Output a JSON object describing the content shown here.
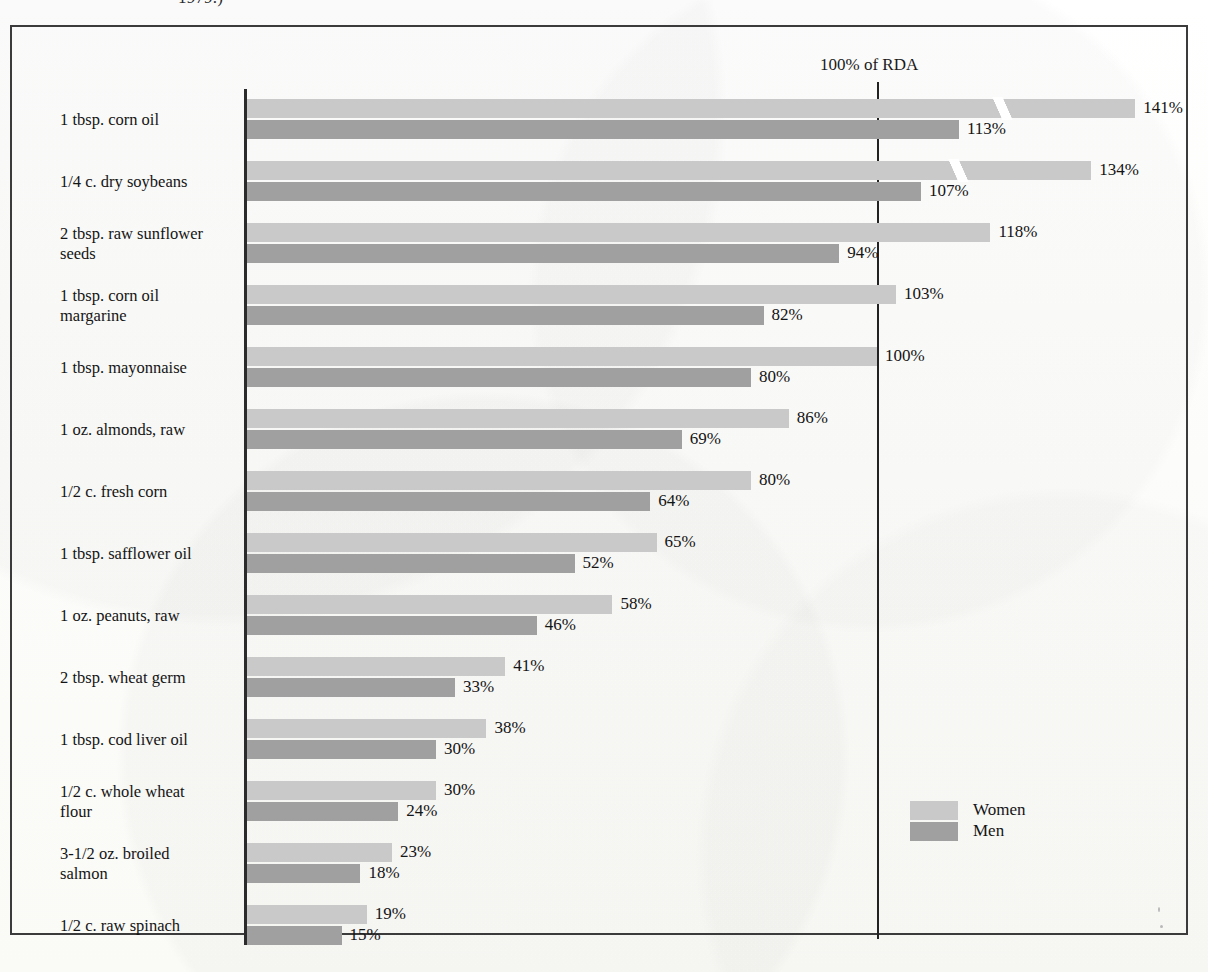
{
  "caption_fragment": "1979.)",
  "reference_line": {
    "label": "100% of RDA",
    "value": 100
  },
  "legend": {
    "items": [
      {
        "name": "Women",
        "color": "#c9c9c9"
      },
      {
        "name": "Men",
        "color": "#a0a0a0"
      }
    ]
  },
  "colors": {
    "women": "#c9c9c9",
    "men": "#a0a0a0",
    "frame": "#3b3b3b",
    "axis": "#2b2b2b",
    "reference_line": "#222222",
    "text": "#141414",
    "background": "#fdfdfc"
  },
  "chart_data": {
    "type": "bar",
    "orientation": "horizontal",
    "title": "",
    "subtitle": "",
    "xlabel": "",
    "ylabel": "",
    "xlim": [
      0,
      141
    ],
    "grid": false,
    "legend_position": "bottom-right",
    "value_suffix": "%",
    "reference_lines": [
      {
        "value": 100,
        "label": "100% of RDA"
      }
    ],
    "scale_break_note": "Bars exceeding about 120% are drawn with a diagonal break slash.",
    "categories": [
      "1 tbsp. corn oil",
      "1/4 c. dry soybeans",
      "2 tbsp. raw sunflower seeds",
      "1 tbsp. corn oil margarine",
      "1 tbsp. mayonnaise",
      "1 oz. almonds, raw",
      "1/2 c. fresh corn",
      "1 tbsp. safflower oil",
      "1 oz. peanuts, raw",
      "2 tbsp. wheat germ",
      "1 tbsp. cod liver oil",
      "1/2 c. whole wheat flour",
      "3-1/2 oz. broiled salmon",
      "1/2 c. raw spinach"
    ],
    "series": [
      {
        "name": "Women",
        "color": "#c9c9c9",
        "values": [
          141,
          134,
          118,
          103,
          100,
          86,
          80,
          65,
          58,
          41,
          38,
          30,
          23,
          19
        ]
      },
      {
        "name": "Men",
        "color": "#a0a0a0",
        "values": [
          113,
          107,
          94,
          82,
          80,
          69,
          64,
          52,
          46,
          33,
          30,
          24,
          18,
          15
        ]
      }
    ]
  },
  "rows": [
    {
      "label": "1 tbsp. corn oil",
      "label_lines": [
        "1 tbsp. corn oil"
      ],
      "women": 141,
      "women_text": "141%",
      "men": 113,
      "men_text": "113%",
      "women_break": true,
      "men_break": false
    },
    {
      "label": "1/4 c. dry soybeans",
      "label_lines": [
        "1/4 c. dry soybeans"
      ],
      "women": 134,
      "women_text": "134%",
      "men": 107,
      "men_text": "107%",
      "women_break": true,
      "men_break": false
    },
    {
      "label": "2 tbsp. raw sunflower seeds",
      "label_lines": [
        "2 tbsp. raw sunflower",
        "seeds"
      ],
      "women": 118,
      "women_text": "118%",
      "men": 94,
      "men_text": "94%",
      "women_break": false,
      "men_break": false
    },
    {
      "label": "1 tbsp. corn oil margarine",
      "label_lines": [
        "1 tbsp. corn oil",
        "margarine"
      ],
      "women": 103,
      "women_text": "103%",
      "men": 82,
      "men_text": "82%",
      "women_break": false,
      "men_break": false
    },
    {
      "label": "1 tbsp. mayonnaise",
      "label_lines": [
        "1 tbsp. mayonnaise"
      ],
      "women": 100,
      "women_text": "100%",
      "men": 80,
      "men_text": "80%",
      "women_break": false,
      "men_break": false
    },
    {
      "label": "1 oz. almonds, raw",
      "label_lines": [
        "1 oz. almonds, raw"
      ],
      "women": 86,
      "women_text": "86%",
      "men": 69,
      "men_text": "69%",
      "women_break": false,
      "men_break": false
    },
    {
      "label": "1/2 c. fresh corn",
      "label_lines": [
        "1/2 c. fresh corn"
      ],
      "women": 80,
      "women_text": "80%",
      "men": 64,
      "men_text": "64%",
      "women_break": false,
      "men_break": false
    },
    {
      "label": "1 tbsp. safflower oil",
      "label_lines": [
        "1 tbsp. safflower oil"
      ],
      "women": 65,
      "women_text": "65%",
      "men": 52,
      "men_text": "52%",
      "women_break": false,
      "men_break": false
    },
    {
      "label": "1 oz. peanuts, raw",
      "label_lines": [
        "1 oz. peanuts, raw"
      ],
      "women": 58,
      "women_text": "58%",
      "men": 46,
      "men_text": "46%",
      "women_break": false,
      "men_break": false
    },
    {
      "label": "2 tbsp. wheat germ",
      "label_lines": [
        "2 tbsp. wheat germ"
      ],
      "women": 41,
      "women_text": "41%",
      "men": 33,
      "men_text": "33%",
      "women_break": false,
      "men_break": false
    },
    {
      "label": "1 tbsp. cod liver oil",
      "label_lines": [
        "1 tbsp. cod liver oil"
      ],
      "women": 38,
      "women_text": "38%",
      "men": 30,
      "men_text": "30%",
      "women_break": false,
      "men_break": false
    },
    {
      "label": "1/2 c. whole wheat flour",
      "label_lines": [
        "1/2 c. whole wheat",
        "flour"
      ],
      "women": 30,
      "women_text": "30%",
      "men": 24,
      "men_text": "24%",
      "women_break": false,
      "men_break": false
    },
    {
      "label": "3-1/2 oz. broiled salmon",
      "label_lines": [
        "3-1/2 oz. broiled",
        "salmon"
      ],
      "women": 23,
      "women_text": "23%",
      "men": 18,
      "men_text": "18%",
      "women_break": false,
      "men_break": false
    },
    {
      "label": "1/2 c. raw spinach",
      "label_lines": [
        "1/2 c. raw spinach"
      ],
      "women": 19,
      "women_text": "19%",
      "men": 15,
      "men_text": "15%",
      "women_break": false,
      "men_break": false
    }
  ]
}
